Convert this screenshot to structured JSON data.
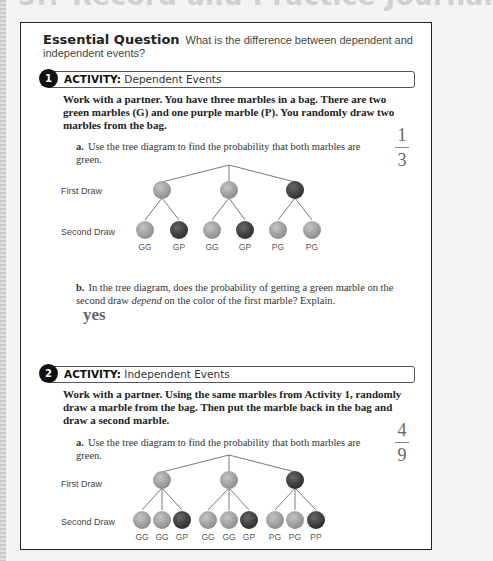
{
  "page": {
    "title": "3.? Record and Practice Journal"
  },
  "essential_question": {
    "label": "Essential Question",
    "text": "What is the difference between dependent and independent events?"
  },
  "activities": [
    {
      "number": "1",
      "label": "ACTIVITY:",
      "title": "Dependent Events",
      "prompt": "Work with a partner. You have three marbles in a bag. There are two green marbles (G) and one purple marble (P). You randomly draw two marbles from the bag.",
      "parts": [
        {
          "letter": "a.",
          "text": "Use the tree diagram to find the probability that both marbles are green.",
          "answer_num": "1",
          "answer_den": "3"
        },
        {
          "letter": "b.",
          "text_before": "In the tree diagram, does the probability of getting a green marble on the second draw ",
          "text_em": "depend",
          "text_after": " on the color of the first marble? Explain.",
          "answer": "yes"
        }
      ],
      "tree": {
        "row_labels": [
          "First Draw",
          "Second Draw"
        ],
        "first_draw": [
          "G",
          "G",
          "P"
        ],
        "outcomes": [
          "GG",
          "GP",
          "GG",
          "GP",
          "PG",
          "PG"
        ]
      }
    },
    {
      "number": "2",
      "label": "ACTIVITY:",
      "title": "Independent Events",
      "prompt": "Work with a partner. Using the same marbles from Activity 1, randomly draw a marble from the bag. Then put the marble back in the bag and draw a second marble.",
      "parts": [
        {
          "letter": "a.",
          "text": "Use the tree diagram to find the probability that both marbles are green.",
          "answer_num": "4",
          "answer_den": "9"
        }
      ],
      "tree": {
        "row_labels": [
          "First Draw",
          "Second Draw"
        ],
        "first_draw": [
          "G",
          "G",
          "P"
        ],
        "outcomes": [
          "GG",
          "GG",
          "GP",
          "GG",
          "GG",
          "GP",
          "PG",
          "PG",
          "PP"
        ]
      }
    }
  ],
  "colors": {
    "green_marble": "#a9a9a9",
    "purple_marble": "#4a4a4a",
    "border": "#222222"
  }
}
